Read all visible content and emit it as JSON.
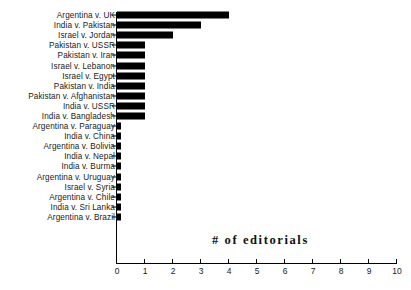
{
  "chart_data": {
    "type": "bar",
    "orientation": "horizontal",
    "title": "# of editorials",
    "xlabel": "# of editorials",
    "ylabel": "",
    "xlim": [
      0,
      10
    ],
    "xticks": [
      0,
      1,
      2,
      3,
      4,
      5,
      6,
      7,
      8,
      9,
      10
    ],
    "xtick_labels": [
      "0",
      "1",
      "2",
      "3",
      "4",
      "5",
      "6",
      "7",
      "8",
      "9",
      "10"
    ],
    "grid": false,
    "legend": null,
    "bar_color": "#000000",
    "categories": [
      "Argentina v. UK",
      "India v. Pakistan",
      "Israel v. Jordan",
      "Pakistan v. USSR",
      "Pakistan v. Iran",
      "Israel v. Lebanon",
      "Israel v. Egypt",
      "Pakistan v. India",
      "Pakistan v. Afghanistan",
      "India v. USSR",
      "India v. Bangladesh",
      "Argentina v. Paraguay",
      "India v. China",
      "Argentina v. Bolivia",
      "India v. Nepal",
      "India v. Burma",
      "Argentina v. Uruguay",
      "Israel v. Syria",
      "Argentina v. Chile",
      "India v. Sri Lanka",
      "Argentina v. Brazil"
    ],
    "values": [
      4,
      3,
      2,
      1,
      1,
      1,
      1,
      1,
      1,
      1,
      1,
      0.14,
      0.14,
      0.14,
      0.14,
      0.14,
      0.14,
      0.14,
      0.14,
      0.14,
      0.14
    ]
  }
}
